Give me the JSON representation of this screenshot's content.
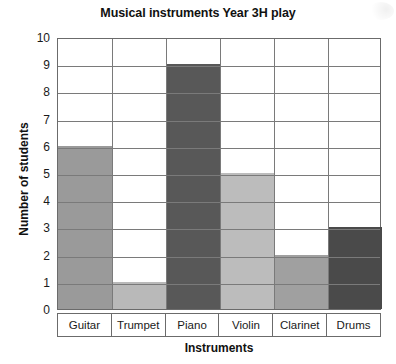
{
  "chart_data": {
    "type": "bar",
    "title": "Musical instruments Year 3H play",
    "xlabel": "Instruments",
    "ylabel": "Number of students",
    "categories": [
      "Guitar",
      "Trumpet",
      "Piano",
      "Violin",
      "Clarinet",
      "Drums"
    ],
    "values": [
      6,
      1,
      9,
      5,
      2,
      3
    ],
    "bar_colors": [
      "#9a9a9a",
      "#b9b9b9",
      "#585858",
      "#bcbcbc",
      "#a0a0a0",
      "#4a4a4a"
    ],
    "ylim": [
      0,
      10
    ],
    "ytick_labels": [
      "10",
      "9",
      "8",
      "7",
      "6",
      "5",
      "4",
      "3",
      "2",
      "1",
      "0"
    ],
    "yticks": [
      10,
      9,
      8,
      7,
      6,
      5,
      4,
      3,
      2,
      1,
      0
    ],
    "grid": "horizontal-and-vertical",
    "legend": null,
    "axis_color": "#6b6b6b",
    "grid_color": "#7a7a7a",
    "background": "#ffffff"
  }
}
